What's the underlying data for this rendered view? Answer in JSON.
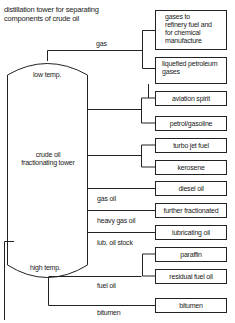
{
  "title": [
    "distillation tower for separating",
    "components of crude oil"
  ],
  "tower": {
    "top_label": "low temp.",
    "center_label": [
      "crude oil",
      "fractionating tower"
    ],
    "bottom_label": "high temp."
  },
  "fractions": [
    {
      "label": "gas"
    },
    {
      "label": "gas oil"
    },
    {
      "label": "heavy gas oil"
    },
    {
      "label": "lub. oil stock"
    },
    {
      "label": "fuel oil"
    },
    {
      "label": "bitumen"
    }
  ],
  "products": [
    {
      "label": [
        "gases to",
        "refinery fuel and",
        "for chemical",
        "manufacture"
      ]
    },
    {
      "label": [
        "liquefied petroleum",
        "gases"
      ]
    },
    {
      "label": "aviation spirit"
    },
    {
      "label": "petrol/gasoline"
    },
    {
      "label": "turbo jet fuel"
    },
    {
      "label": "kerosene"
    },
    {
      "label": "diesel oil"
    },
    {
      "label": "further fractionated"
    },
    {
      "label": "lubricating oil"
    },
    {
      "label": "paraffin"
    },
    {
      "label": "residual fuel oil"
    },
    {
      "label": "bitumen"
    }
  ]
}
